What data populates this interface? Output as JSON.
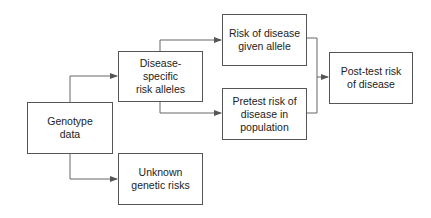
{
  "diagram": {
    "colors": {
      "border": "#555555",
      "line": "#666666",
      "text": "#222222",
      "background": "#ffffff"
    },
    "nodes": [
      {
        "id": "genotype",
        "label": "Genotype\ndata"
      },
      {
        "id": "disease-specific",
        "label": "Disease-specific\nrisk alleles"
      },
      {
        "id": "unknown",
        "label": "Unknown\ngenetic risks"
      },
      {
        "id": "risk-given-allele",
        "label": "Risk of disease\ngiven allele"
      },
      {
        "id": "pretest",
        "label": "Pretest risk of\ndisease in\npopulation"
      },
      {
        "id": "post-test",
        "label": "Post-test risk\nof disease"
      }
    ],
    "edges": [
      {
        "from": "genotype",
        "to": "disease-specific"
      },
      {
        "from": "genotype",
        "to": "unknown"
      },
      {
        "from": "disease-specific",
        "to": "risk-given-allele"
      },
      {
        "from": "disease-specific",
        "to": "pretest"
      },
      {
        "from": "risk-given-allele",
        "to": "post-test"
      },
      {
        "from": "pretest",
        "to": "post-test"
      }
    ]
  }
}
